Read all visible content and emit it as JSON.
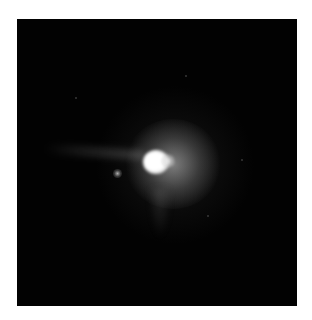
{
  "image": {
    "subject": "astronomical-point-source",
    "description": "Grayscale telescope image of a bright star-like point source with diffuse halo, a faint companion to the lower-left and a faint horizontal streak to the left, on a black background",
    "colors": {
      "page_background": "#ffffff",
      "sky_background": "#020202",
      "core": "#ffffff",
      "halo": "#8c8c8c"
    },
    "objects": [
      {
        "name": "primary-source",
        "center_px": [
          156,
          160
        ]
      },
      {
        "name": "companion-source",
        "center_px": [
          118,
          173
        ]
      },
      {
        "name": "left-streak",
        "span_px": [
          45,
          130
        ],
        "y_px": 152
      }
    ]
  }
}
